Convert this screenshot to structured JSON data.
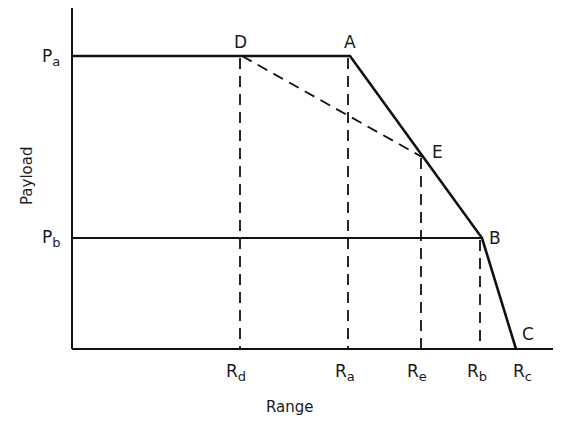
{
  "diagram": {
    "type": "payload-range diagram",
    "x_axis_title": "Range",
    "y_axis_title": "Payload",
    "y_ticks": [
      {
        "main": "P",
        "sub": "a",
        "name": "Pa"
      },
      {
        "main": "P",
        "sub": "b",
        "name": "Pb"
      }
    ],
    "x_ticks": [
      {
        "main": "R",
        "sub": "d",
        "name": "Rd"
      },
      {
        "main": "R",
        "sub": "a",
        "name": "Ra"
      },
      {
        "main": "R",
        "sub": "e",
        "name": "Re"
      },
      {
        "main": "R",
        "sub": "b",
        "name": "Rb"
      },
      {
        "main": "R",
        "sub": "c",
        "name": "Rc"
      }
    ],
    "points": {
      "A": "A",
      "B": "B",
      "C": "C",
      "D": "D",
      "E": "E"
    },
    "solid_path": [
      "Pa",
      "A",
      "E",
      "B",
      "C"
    ],
    "horizontal_line_pb": [
      "Pb",
      "B"
    ],
    "dashed_segments": [
      "D-E",
      "D-Rd",
      "A-Ra",
      "E-Re",
      "B-Rb"
    ],
    "line_color": "#111111"
  }
}
